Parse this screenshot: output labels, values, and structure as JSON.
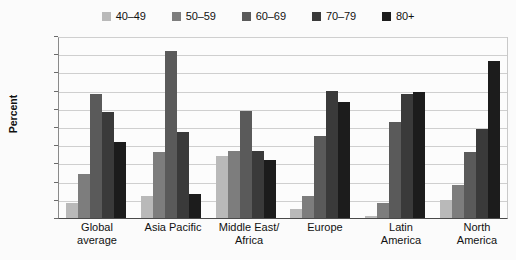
{
  "chart_data": {
    "type": "bar",
    "title": "",
    "xlabel": "",
    "ylabel": "Percent",
    "ylim": [
      0,
      50
    ],
    "ytick_labels": [
      "50%",
      "45",
      "40",
      "35",
      "30",
      "25",
      "20",
      "15",
      "10",
      "5",
      "0"
    ],
    "ytick_values": [
      50,
      45,
      40,
      35,
      30,
      25,
      20,
      15,
      10,
      5,
      0
    ],
    "grid": true,
    "legend_position": "top",
    "categories": [
      "Global average",
      "Asia Pacific",
      "Middle East/ Africa",
      "Europe",
      "Latin America",
      "North America"
    ],
    "category_lines": [
      [
        "Global",
        "average"
      ],
      [
        "Asia Pacific",
        ""
      ],
      [
        "Middle East/",
        "Africa"
      ],
      [
        "Europe",
        ""
      ],
      [
        "Latin",
        "America"
      ],
      [
        "North",
        "America"
      ]
    ],
    "series": [
      {
        "name": "40–49",
        "color": "#b9b9b9",
        "values": [
          4,
          6,
          17,
          2.5,
          0.5,
          5
        ]
      },
      {
        "name": "50–59",
        "color": "#7d7d7d",
        "values": [
          12,
          18,
          18.5,
          6,
          4,
          9
        ]
      },
      {
        "name": "60–69",
        "color": "#5a5a5a",
        "values": [
          34,
          46,
          29.5,
          22.5,
          26.5,
          18
        ]
      },
      {
        "name": "70–79",
        "color": "#3a3a3a",
        "values": [
          29,
          23.5,
          18.5,
          35,
          34,
          24.5
        ]
      },
      {
        "name": "80+",
        "color": "#1c1c1c",
        "values": [
          21,
          6.5,
          16,
          32,
          34.5,
          43
        ]
      }
    ]
  },
  "axis": {
    "y_title": "Percent"
  }
}
